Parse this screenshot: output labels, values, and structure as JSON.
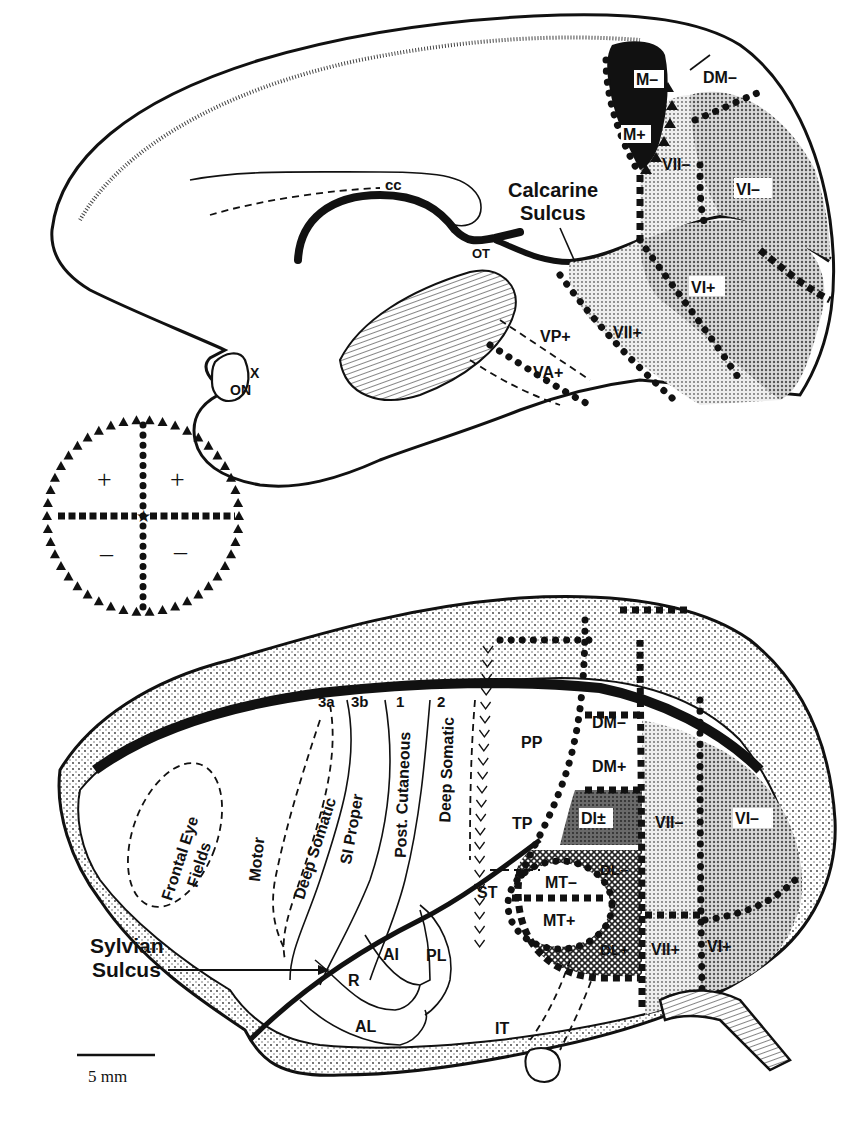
{
  "figure": {
    "medial_view": {
      "labels": {
        "cc": "cc",
        "ot": "OT",
        "x": "X",
        "on": "ON",
        "calcarine_sulcus": [
          "Calcarine",
          "Sulcus"
        ],
        "m_minus": "M–",
        "m_plus": "M+",
        "dm_minus": "DM–",
        "v2_minus": "VII–",
        "v1_minus": "VI–",
        "v1_plus": "VI+",
        "v2_plus": "VII+",
        "vp_plus": "VP+",
        "va_plus": "VA+"
      }
    },
    "legend": {
      "upper_left": "+",
      "upper_right": "+",
      "lower_left": "–",
      "lower_right": "–",
      "border_meaning": [
        "horizontal meridian (squares)",
        "vertical meridian (circles)",
        "periphery (triangles)",
        "center of gaze (star)"
      ]
    },
    "lateral_view": {
      "labels": {
        "area_3a": "3a",
        "area_3b": "3b",
        "area_1": "1",
        "area_2": "2",
        "frontal_eye_fields": [
          "Frontal Eye",
          "Fields"
        ],
        "motor": "Motor",
        "deep_somatic_left": "Deep Somatic",
        "si_proper": "SI Proper",
        "post_cutaneous": "Post. Cutaneous",
        "deep_somatic_right": "Deep Somatic",
        "pp": "PP",
        "tp": "TP",
        "st": "ST",
        "it": "IT",
        "r": "R",
        "ai": "AI",
        "pl": "PL",
        "al": "AL",
        "sylvian_sulcus": [
          "Sylvian",
          "Sulcus"
        ],
        "dm_minus": "DM–",
        "dm_plus": "DM+",
        "di": "DI±",
        "dl_minus": "DL–",
        "dl_plus": "DL+",
        "mt_minus": "MT–",
        "mt_plus": "MT+",
        "v2_minus": "VII–",
        "v2_plus": "VII+",
        "v1_minus": "VI–",
        "v1_plus": "VI+"
      }
    },
    "scale_bar": {
      "label": "5 mm"
    },
    "colors": {
      "ink": "#111111",
      "paper": "#ffffff",
      "v1_fill": "#b8b8b8",
      "v2_fill": "#d6d6d6",
      "di_fill": "#8a8a8a",
      "dl_fill": "#9c9c9c",
      "m_fill": "#111111"
    }
  }
}
